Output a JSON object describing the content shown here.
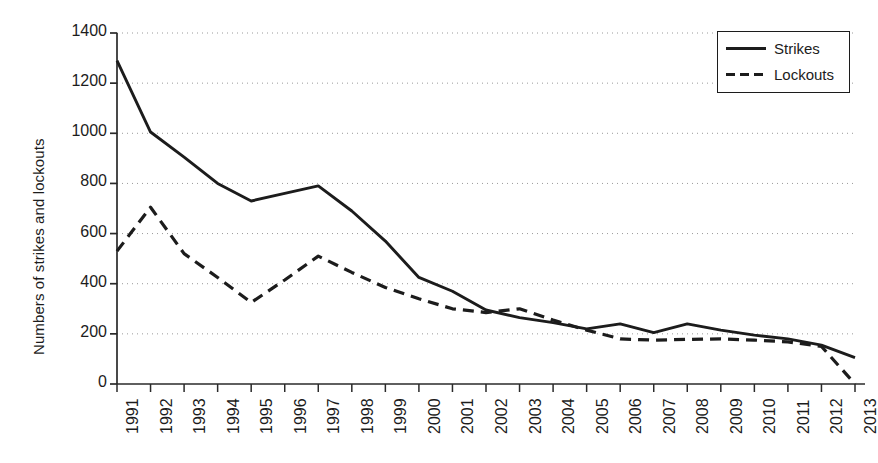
{
  "chart_data": {
    "type": "line",
    "title": "",
    "xlabel": "",
    "ylabel": "Numbers of strikes and lockouts",
    "ylim": [
      0,
      1400
    ],
    "yticks": [
      0,
      200,
      400,
      600,
      800,
      1000,
      1200,
      1400
    ],
    "grid": true,
    "grid_style": "dotted-horizontal",
    "legend_position": "top-right",
    "categories": [
      "1991",
      "1992",
      "1993",
      "1994",
      "1995",
      "1996",
      "1997",
      "1998",
      "1999",
      "2000",
      "2001",
      "2002",
      "2003",
      "2004",
      "2005",
      "2006",
      "2007",
      "2008",
      "2009",
      "2010",
      "2011",
      "2012",
      "2013"
    ],
    "series": [
      {
        "name": "Strikes",
        "line_style": "solid",
        "color": "#1c1c1c",
        "values": [
          1290,
          1005,
          905,
          800,
          730,
          760,
          790,
          690,
          570,
          425,
          370,
          295,
          265,
          245,
          220,
          240,
          205,
          240,
          215,
          195,
          180,
          155,
          105
        ]
      },
      {
        "name": "Lockouts",
        "line_style": "dashed",
        "color": "#1c1c1c",
        "values": [
          530,
          705,
          520,
          425,
          325,
          415,
          510,
          445,
          385,
          340,
          300,
          285,
          300,
          255,
          215,
          180,
          175,
          178,
          180,
          175,
          168,
          150,
          0
        ]
      }
    ]
  },
  "legend": {
    "items": [
      {
        "label": "Strikes",
        "style": "solid"
      },
      {
        "label": "Lockouts",
        "style": "dashed"
      }
    ]
  }
}
